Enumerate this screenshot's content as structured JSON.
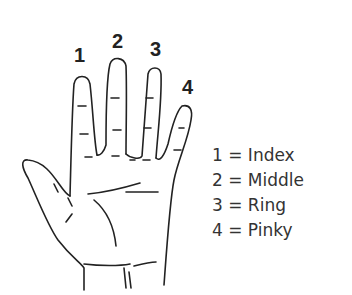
{
  "finger_numbers": [
    {
      "label": "1",
      "finger": "index"
    },
    {
      "label": "2",
      "finger": "middle"
    },
    {
      "label": "3",
      "finger": "ring"
    },
    {
      "label": "4",
      "finger": "pinky"
    }
  ],
  "legend": [
    {
      "text": "1 = Index"
    },
    {
      "text": "2 = Middle"
    },
    {
      "text": "3 = Ring"
    },
    {
      "text": "4 = Pinky"
    }
  ]
}
